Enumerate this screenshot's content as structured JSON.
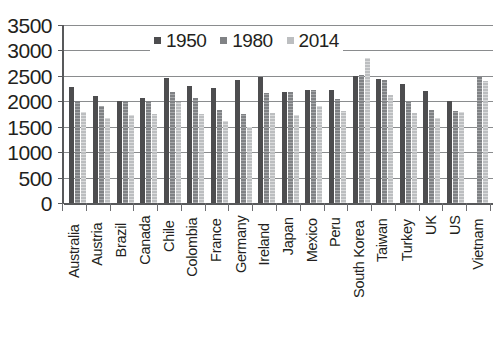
{
  "chart_data": {
    "type": "bar",
    "title": "",
    "xlabel": "",
    "ylabel": "",
    "ylim": [
      0,
      3500
    ],
    "yticks": [
      0,
      500,
      1000,
      1500,
      2000,
      2500,
      3000,
      3500
    ],
    "ytick_labels": [
      "0",
      "500",
      "1000",
      "1500",
      "2000",
      "2500",
      "3000",
      "3500"
    ],
    "grid": true,
    "legend_position": "top-center",
    "categories": [
      "Australia",
      "Austria",
      "Brazil",
      "Canada",
      "Chile",
      "Colombia",
      "France",
      "Germany",
      "Ireland",
      "Japan",
      "Mexico",
      "Peru",
      "South Korea",
      "Taiwan",
      "Turkey",
      "UK",
      "US",
      "Vietnam"
    ],
    "series": [
      {
        "name": "1950",
        "color": "#4d4d4f",
        "values": [
          2280,
          2100,
          2010,
          2070,
          2460,
          2300,
          2270,
          2420,
          2470,
          2190,
          2230,
          2220,
          2490,
          2440,
          2350,
          2200,
          2010,
          null
        ]
      },
      {
        "name": "1980",
        "color": "#808285",
        "values": [
          2010,
          1910,
          2010,
          2010,
          2180,
          2070,
          1830,
          1760,
          2160,
          2180,
          2230,
          2040,
          2520,
          2420,
          1980,
          1830,
          1810,
          2480
        ]
      },
      {
        "name": "2014",
        "color": "#bcbec0",
        "values": [
          1780,
          1670,
          1740,
          1760,
          1990,
          1760,
          1610,
          1490,
          1770,
          1730,
          1900,
          1810,
          2860,
          2120,
          1770,
          1680,
          1780,
          2400
        ]
      }
    ]
  },
  "legend": {
    "items": [
      {
        "label": "1950",
        "swatch": "series-1950-swatch"
      },
      {
        "label": "1980",
        "swatch": "series-1980-swatch"
      },
      {
        "label": "2014",
        "swatch": "series-2014-swatch"
      }
    ]
  },
  "source_note": ""
}
